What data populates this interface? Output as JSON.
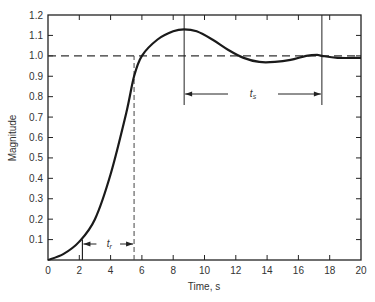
{
  "chart_data": {
    "type": "line",
    "title": "",
    "xlabel": "Time, s",
    "ylabel": "Magnitude",
    "xlim": [
      0,
      20
    ],
    "ylim": [
      0,
      1.2
    ],
    "x_ticks": [
      0,
      2,
      4,
      6,
      8,
      10,
      12,
      14,
      16,
      18,
      20
    ],
    "y_ticks": [
      0.1,
      0.2,
      0.3,
      0.4,
      0.5,
      0.6,
      0.7,
      0.8,
      0.9,
      1.0,
      1.1,
      1.2
    ],
    "x_tick_labels": [
      "0",
      "2",
      "4",
      "6",
      "8",
      "10",
      "12",
      "14",
      "16",
      "18",
      "20"
    ],
    "y_tick_labels": [
      "0.1",
      "0.2",
      "0.3",
      "0.4",
      "0.5",
      "0.6",
      "0.7",
      "0.8",
      "0.9",
      "1.0",
      "1.1",
      "1.2"
    ],
    "grid": false,
    "legend": null,
    "series": [
      {
        "name": "Step response",
        "x": [
          0,
          1,
          2,
          3,
          4,
          5,
          5.5,
          6,
          7,
          8,
          8.7,
          9.5,
          10.5,
          11.5,
          12.5,
          13.5,
          14.5,
          15.5,
          16.5,
          17.2,
          17.5,
          18.5,
          20
        ],
        "values": [
          0,
          0.03,
          0.09,
          0.2,
          0.42,
          0.72,
          0.9,
          1.0,
          1.08,
          1.12,
          1.13,
          1.12,
          1.08,
          1.03,
          0.99,
          0.97,
          0.97,
          0.98,
          1.0,
          1.005,
          1.0,
          0.99,
          0.99
        ]
      }
    ],
    "reference_line": {
      "y": 1.0,
      "style": "dashed"
    },
    "annotations": [
      {
        "label": "t_r",
        "text": "tr",
        "from_x": 2.2,
        "to_x": 5.5,
        "description": "Rise time interval between 10% and 90%"
      },
      {
        "label": "t_s",
        "text": "ts",
        "from_x": 8.7,
        "to_x": 17.5,
        "description": "Settling time interval from peak to settling"
      }
    ],
    "markers": [
      {
        "x": 2.2,
        "type": "vertical-line",
        "description": "10% crossing"
      },
      {
        "x": 5.5,
        "type": "vertical-dashed-line",
        "description": "90% crossing"
      },
      {
        "x": 8.7,
        "type": "vertical-line",
        "description": "Peak time"
      },
      {
        "x": 17.5,
        "type": "vertical-line",
        "description": "Settling point"
      }
    ]
  }
}
